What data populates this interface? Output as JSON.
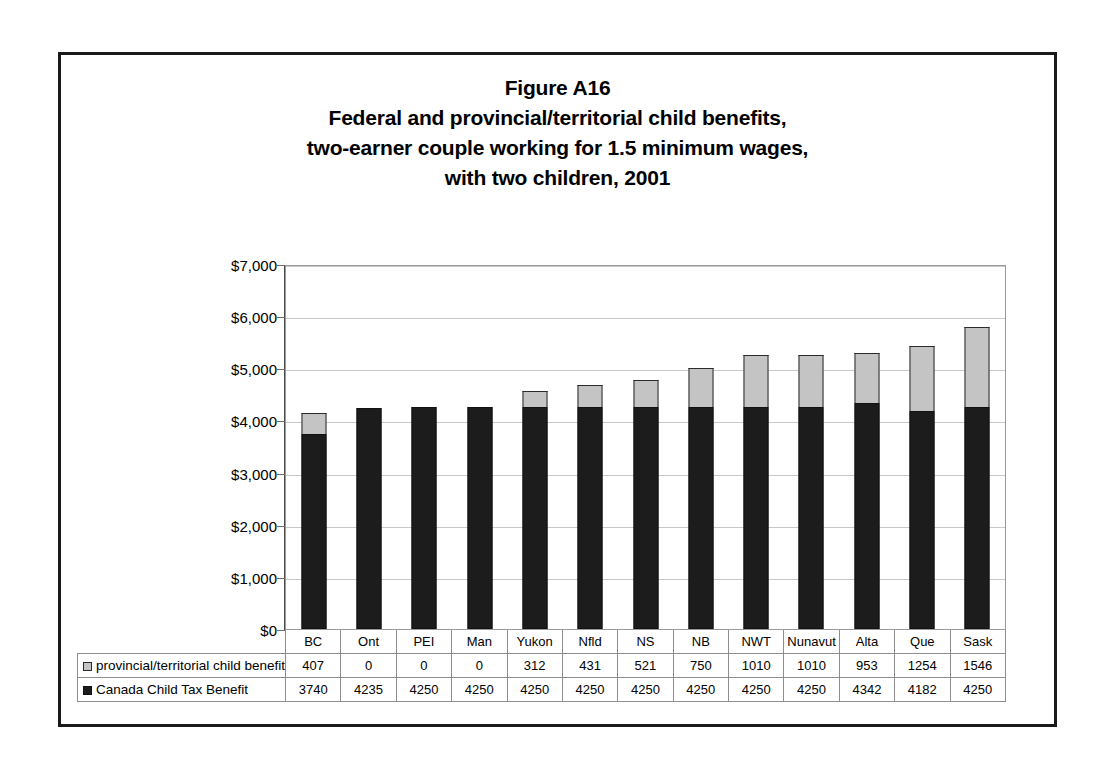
{
  "figure": {
    "title_lines": [
      "Figure A16",
      "Federal and provincial/territorial child benefits,",
      "two-earner couple working for 1.5 minimum wages,",
      "with two children, 2001"
    ]
  },
  "legend": {
    "provincial_label": "provincial/territorial child benefits",
    "federal_label": "Canada Child Tax Benefit",
    "provincial_swatch": "light-gray-square",
    "federal_swatch": "black-square"
  },
  "axis": {
    "y_ticks": [
      "$0",
      "$1,000",
      "$2,000",
      "$3,000",
      "$4,000",
      "$5,000",
      "$6,000",
      "$7,000"
    ]
  },
  "chart_data": {
    "type": "bar",
    "xlabel": "",
    "ylabel": "",
    "ylim": [
      0,
      7000
    ],
    "ytick_step": 1000,
    "grid": true,
    "stacked": true,
    "legend_position": "bottom-table",
    "categories": [
      "BC",
      "Ont",
      "PEI",
      "Man",
      "Yukon",
      "Nfld",
      "NS",
      "NB",
      "NWT",
      "Nunavut",
      "Alta",
      "Que",
      "Sask"
    ],
    "series": [
      {
        "name": "provincial/territorial child benefits",
        "color": "#c4c4c4",
        "values": [
          407,
          0,
          0,
          0,
          312,
          431,
          521,
          750,
          1010,
          1010,
          953,
          1254,
          1546
        ]
      },
      {
        "name": "Canada Child Tax Benefit",
        "color": "#1c1c1c",
        "values": [
          3740,
          4235,
          4250,
          4250,
          4250,
          4250,
          4250,
          4250,
          4250,
          4250,
          4342,
          4182,
          4250
        ]
      }
    ],
    "totals": [
      4147,
      4235,
      4250,
      4250,
      4562,
      4681,
      4771,
      5000,
      5260,
      5260,
      5295,
      5436,
      5796
    ]
  }
}
